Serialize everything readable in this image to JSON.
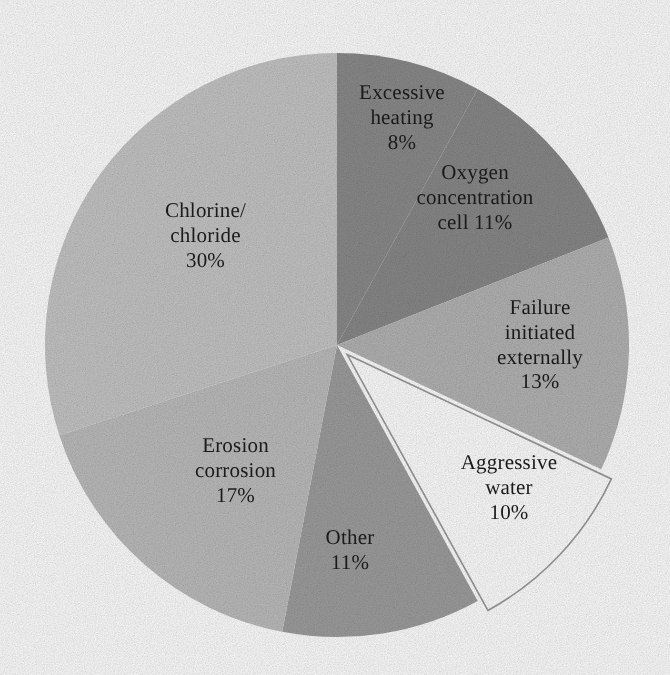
{
  "chart_data": {
    "type": "pie",
    "title": "",
    "subtitle": "",
    "xlabel": "",
    "ylabel": "",
    "legend_position": "none",
    "grid": false,
    "units": "percent",
    "total": 100,
    "start_angle_deg": 0,
    "direction": "clockwise",
    "categories": [
      "Excessive heating",
      "Oxygen concentration cell",
      "Failure initiated externally",
      "Aggressive water",
      "Other",
      "Erosion corrosion",
      "Chlorine/chloride"
    ],
    "values": [
      8,
      11,
      13,
      10,
      11,
      17,
      30
    ],
    "colors": [
      "#8b8b8b",
      "#898989",
      "#b4b4b4",
      "#ffffff",
      "#9e9e9e",
      "#bdbdbd",
      "#c6c6c6"
    ],
    "slices": [
      {
        "name": "Excessive heating",
        "value": 8,
        "label": "Excessive\nheating\n8%",
        "label_text": "Excessive heating",
        "value_text": "8%",
        "color": "#8b8b8b",
        "exploded": false
      },
      {
        "name": "Oxygen concentration cell",
        "value": 11,
        "label": "Oxygen\nconcentration\ncell 11%",
        "label_text": "Oxygen concentration cell",
        "value_text": "11%",
        "color": "#898989",
        "exploded": false
      },
      {
        "name": "Failure initiated externally",
        "value": 13,
        "label": "Failure\ninitiated\nexternally\n13%",
        "label_text": "Failure initiated externally",
        "value_text": "13%",
        "color": "#b4b4b4",
        "exploded": false
      },
      {
        "name": "Aggressive water",
        "value": 10,
        "label": "Aggressive\nwater\n10%",
        "label_text": "Aggressive water",
        "value_text": "10%",
        "color": "#ffffff",
        "exploded": true
      },
      {
        "name": "Other",
        "value": 11,
        "label": "Other\n11%",
        "label_text": "Other",
        "value_text": "11%",
        "color": "#9e9e9e",
        "exploded": false
      },
      {
        "name": "Erosion corrosion",
        "value": 17,
        "label": "Erosion\ncorrosion\n17%",
        "label_text": "Erosion corrosion",
        "value_text": "17%",
        "color": "#bdbdbd",
        "exploded": false
      },
      {
        "name": "Chlorine/chloride",
        "value": 30,
        "label": "Chlorine/\nchloride\n30%",
        "label_text": "Chlorine/chloride",
        "value_text": "30%",
        "color": "#c6c6c6",
        "exploded": false
      }
    ]
  },
  "geometry": {
    "center_x": 337,
    "center_y": 345,
    "radius": 292,
    "explode_offset": 14,
    "outline_color": "#9a9a9a"
  }
}
